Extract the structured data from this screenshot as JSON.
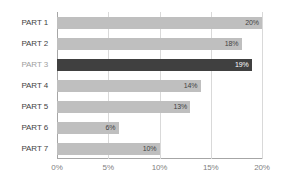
{
  "chart_data": {
    "type": "bar",
    "orientation": "horizontal",
    "title": "",
    "subtitle": "",
    "xlabel": "",
    "ylabel": "",
    "categories": [
      "PART 1",
      "PART 2",
      "PART 3",
      "PART 4",
      "PART 5",
      "PART 6",
      "PART 7"
    ],
    "values": [
      20,
      18,
      19,
      14,
      13,
      6,
      10
    ],
    "value_labels": [
      "20%",
      "18%",
      "19%",
      "14%",
      "13%",
      "6%",
      "10%"
    ],
    "highlight_index": 2,
    "xlim": [
      0,
      20
    ],
    "xticks": [
      0,
      5,
      10,
      15,
      20
    ],
    "xtick_labels": [
      "0%",
      "5%",
      "10%",
      "15%",
      "20%"
    ],
    "grid": true,
    "grid_axis": "x",
    "legend": false,
    "legend_position": "none",
    "colors": {
      "bar": "#bfbfbf",
      "bar_highlight": "#404040",
      "value_label": "#3f3f3f",
      "value_label_highlight": "#ffffff",
      "category_label": "#3f3f3f",
      "category_label_highlight": "#a0a0a0",
      "gridline": "#d9d9d9",
      "axis": "#a6a6a6",
      "tick_label": "#7f7f7f",
      "background": "#ffffff"
    }
  }
}
